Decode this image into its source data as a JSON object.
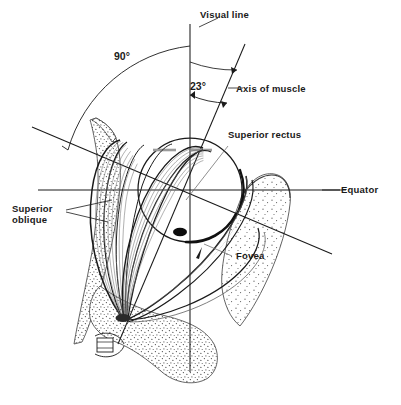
{
  "figure": {
    "kind": "anatomical-diagram",
    "background_color": "#ffffff",
    "ink_color": "#1a1a1a",
    "stipple_color": "#5a5a5a",
    "accent_gray": "#8a8a8a"
  },
  "labels": {
    "visual_line": "Visual line",
    "axis_of_muscle": "Axis of muscle",
    "superior_rectus": "Superior rectus",
    "superior_oblique": "Superior\noblique",
    "equator": "Equator",
    "fovea": "Fovea"
  },
  "angles": {
    "ninety": "90°",
    "twentythree": "23°"
  },
  "anatomy": {
    "globe_center_x": 190,
    "globe_center_y": 190,
    "globe_radius": 52,
    "fovea_x": 180,
    "fovea_y": 232,
    "muscle_origin_x": 120,
    "muscle_origin_y": 318
  }
}
